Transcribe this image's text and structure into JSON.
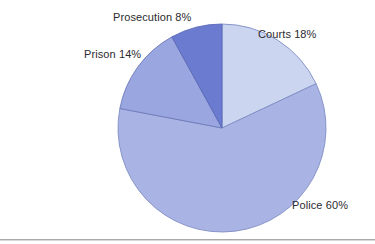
{
  "background_color": "#ffffff",
  "rule_color": "#9a9a9a",
  "label_color": "#2b2b2f",
  "geometry": {
    "center_x": 222,
    "center_y": 128,
    "radius": 104,
    "start_angle_deg": -90,
    "direction": "clockwise"
  },
  "chart_data": {
    "type": "pie",
    "title": "",
    "subtitle": "",
    "xlabel": "",
    "ylabel": "",
    "grid": false,
    "legend_position": "none",
    "labels_position": "outside-callout",
    "total": 100,
    "units": "%",
    "categories": [
      "Courts",
      "Police",
      "Prison",
      "Prosecution"
    ],
    "values": [
      18,
      60,
      14,
      8
    ],
    "slices": [
      {
        "name": "Courts",
        "value": 18,
        "label": "Courts 18%",
        "color": "#ccd5f0",
        "stroke": "#7f8dc4",
        "start_deg": 0,
        "end_deg": 64.8
      },
      {
        "name": "Police",
        "value": 60,
        "label": "Police 60%",
        "color": "#aab4e4",
        "stroke": "#7f8dc4",
        "start_deg": 64.8,
        "end_deg": 280.8
      },
      {
        "name": "Prison",
        "value": 14,
        "label": "Prison 14%",
        "color": "#9aa6e0",
        "stroke": "#6d7ab8",
        "start_deg": 280.8,
        "end_deg": 331.2
      },
      {
        "name": "Prosecution",
        "value": 8,
        "label": "Prosecution 8%",
        "color": "#6b7bd0",
        "stroke": "#5a68b8",
        "start_deg": 331.2,
        "end_deg": 360
      }
    ],
    "annotations": [
      {
        "text": "Prosecution 8%",
        "for": "Prosecution"
      },
      {
        "text": "Courts 18%",
        "for": "Courts"
      },
      {
        "text": "Prison 14%",
        "for": "Prison"
      },
      {
        "text": "Police 60%",
        "for": "Police"
      }
    ]
  }
}
